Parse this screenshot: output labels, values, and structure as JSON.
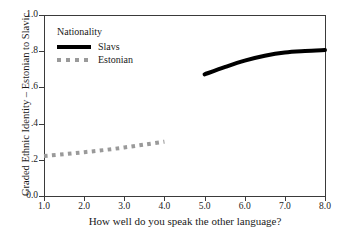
{
  "chart_data": {
    "type": "line",
    "title": "",
    "xlabel": "How well do you speak the other language?",
    "ylabel": "Graded Ethnic Identity – Estonian to Slavic",
    "xlim": [
      1.0,
      8.0
    ],
    "ylim": [
      0.0,
      1.0
    ],
    "grid": false,
    "legend_position": "top-left inside",
    "legend_title": "Nationality",
    "xticks": [
      "1.0",
      "2.0",
      "3.0",
      "4.0",
      "5.0",
      "6.0",
      "7.0",
      "8.0"
    ],
    "xtick_values": [
      1.0,
      2.0,
      3.0,
      4.0,
      5.0,
      6.0,
      7.0,
      8.0
    ],
    "yticks": [
      "0.0",
      ".2",
      ".4",
      ".6",
      ".8",
      "1.0"
    ],
    "ytick_values": [
      0.0,
      0.2,
      0.4,
      0.6,
      0.8,
      1.0
    ],
    "series": [
      {
        "name": "Slavs",
        "style": "solid",
        "color": "#000000",
        "width": 4,
        "x": [
          5.0,
          5.5,
          6.0,
          6.5,
          7.0,
          7.5,
          8.0
        ],
        "values": [
          0.672,
          0.712,
          0.748,
          0.775,
          0.793,
          0.801,
          0.806
        ]
      },
      {
        "name": "Estonian",
        "style": "dotted",
        "color": "#9a9a9a",
        "width": 4,
        "x": [
          1.0,
          1.5,
          2.0,
          2.5,
          3.0,
          3.5,
          4.0
        ],
        "values": [
          0.221,
          0.231,
          0.242,
          0.254,
          0.268,
          0.284,
          0.3
        ]
      }
    ]
  },
  "axes": {
    "xlabel": "How well do you speak the other language?",
    "ylabel": "Graded Ethnic Identity – Estonian to Slavic"
  },
  "legend": {
    "title": "Nationality",
    "entries": [
      {
        "label": "Slavs",
        "swatch": "solid-line-swatch"
      },
      {
        "label": "Estonian",
        "swatch": "dotted-line-swatch"
      }
    ]
  },
  "colors": {
    "slavs": "#000000",
    "estonian": "#9a9a9a",
    "axis": "#3a3a3a",
    "background": "#ffffff"
  }
}
